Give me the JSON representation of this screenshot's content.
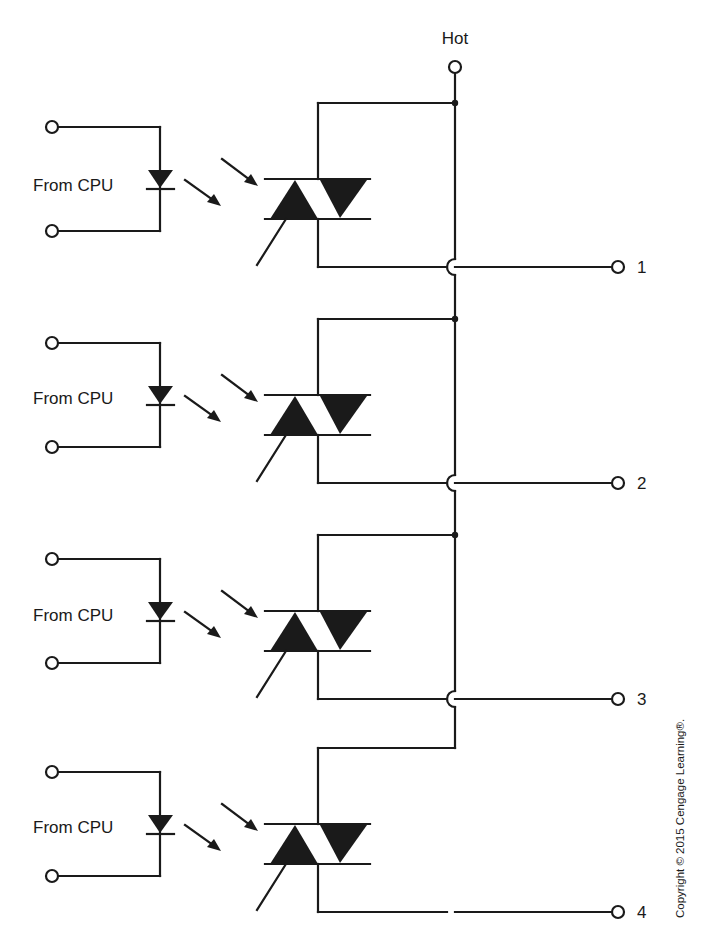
{
  "diagram": {
    "type": "circuit-schematic",
    "supply": {
      "label": "Hot"
    },
    "channels": [
      {
        "input_label": "From CPU",
        "output_label": "1",
        "offset_y": 0,
        "top_junction_dot": true
      },
      {
        "input_label": "From CPU",
        "output_label": "2",
        "offset_y": 216,
        "top_junction_dot": true
      },
      {
        "input_label": "From CPU",
        "output_label": "3",
        "offset_y": 432,
        "top_junction_dot": true
      },
      {
        "input_label": "From CPU",
        "output_label": "4",
        "offset_y": 645,
        "top_junction_dot": false
      }
    ],
    "components": [
      "input-terminal",
      "led-diode",
      "light-arrows",
      "photo-triac",
      "hot-bus",
      "output-terminal",
      "wire-crossover"
    ],
    "copyright": "Copyright © 2015 Cengage Learning®."
  }
}
